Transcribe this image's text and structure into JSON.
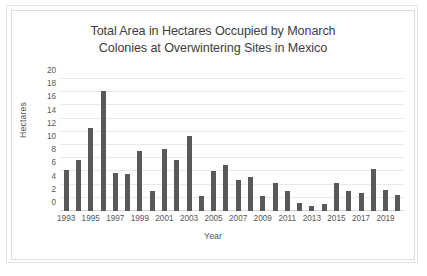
{
  "chart_data": {
    "type": "bar",
    "title": "Total Area in Hectares Occupied by Monarch Colonies at Overwintering Sites in Mexico",
    "title_lines": [
      "Total Area in Hectares Occupied by Monarch",
      "Colonies at Overwintering Sites in Mexico"
    ],
    "xlabel": "Year",
    "ylabel": "Hectares",
    "ylim": [
      0,
      20
    ],
    "ytick_values": [
      0,
      2,
      4,
      6,
      8,
      10,
      12,
      14,
      16,
      18,
      20
    ],
    "ytick_labels": [
      "0",
      "2",
      "4",
      "6",
      "8",
      "10",
      "12",
      "14",
      "16",
      "18",
      "20"
    ],
    "xtick_labels": [
      "1993",
      "1995",
      "1997",
      "1999",
      "2001",
      "2003",
      "2005",
      "2007",
      "2009",
      "2011",
      "2013",
      "2015",
      "2017",
      "2019"
    ],
    "grid": true,
    "legend": "none",
    "bar_color": "#595959",
    "gridline_color": "#e8e8e8",
    "categories": [
      "1993",
      "1994",
      "1995",
      "1996",
      "1997",
      "1998",
      "1999",
      "2000",
      "2001",
      "2002",
      "2003",
      "2004",
      "2005",
      "2006",
      "2007",
      "2008",
      "2009",
      "2010",
      "2011",
      "2012",
      "2013",
      "2014",
      "2015",
      "2016",
      "2017",
      "2018",
      "2019",
      "2020"
    ],
    "values": [
      6.2,
      7.8,
      12.6,
      18.2,
      5.8,
      5.6,
      9.1,
      3.0,
      9.4,
      7.8,
      11.3,
      2.2,
      6.1,
      7.0,
      4.7,
      5.2,
      2.2,
      4.3,
      3.1,
      1.2,
      0.7,
      1.1,
      4.3,
      3.1,
      2.8,
      6.3,
      3.2,
      2.5
    ]
  }
}
